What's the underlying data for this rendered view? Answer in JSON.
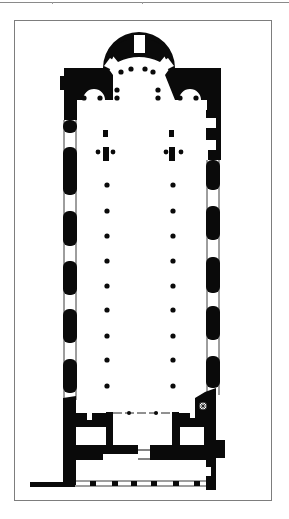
{
  "figure": {
    "type": "architectural-floor-plan",
    "colors": {
      "wall": "#0a0a0a",
      "background": "#ffffff",
      "frame": "#7d7d7d",
      "rule": "#8a8a8a"
    }
  },
  "plan": {
    "nave_columns": {
      "x": [
        107,
        173
      ],
      "y": [
        185,
        211,
        236,
        261,
        286,
        310,
        336,
        360,
        386
      ],
      "r": 2.6
    },
    "apse_columns": [
      [
        121,
        72
      ],
      [
        131,
        69
      ],
      [
        145,
        69
      ],
      [
        153,
        72
      ],
      [
        117,
        90
      ],
      [
        158,
        90
      ],
      [
        117,
        98
      ],
      [
        158,
        98
      ],
      [
        84,
        98
      ],
      [
        100,
        98
      ],
      [
        180,
        98
      ],
      [
        196,
        98
      ]
    ],
    "left_wall_piers": [
      [
        120,
        133
      ],
      [
        147,
        195
      ],
      [
        211,
        246
      ],
      [
        261,
        295
      ],
      [
        309,
        343
      ],
      [
        359,
        393
      ]
    ],
    "right_wall_piers": [
      [
        160,
        190
      ],
      [
        206,
        240
      ],
      [
        257,
        293
      ],
      [
        306,
        340
      ],
      [
        356,
        388
      ]
    ],
    "narthex_door_posts": [
      90,
      112,
      131,
      151,
      173,
      194
    ]
  }
}
